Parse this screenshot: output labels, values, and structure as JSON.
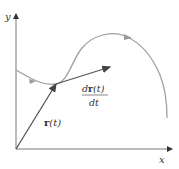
{
  "diagram": {
    "labels": {
      "y_axis": "y",
      "x_axis": "x",
      "position_vector": {
        "bold": "r",
        "arg": "(t)"
      },
      "derivative_numerator": {
        "d": "d",
        "bold": "r",
        "arg": "(t)"
      },
      "derivative_denominator": "dt"
    },
    "colors": {
      "axis": "#555555",
      "curve": "#9a9a9a",
      "vector": "#444444",
      "curve_arrow": "#8a8a8a"
    }
  }
}
